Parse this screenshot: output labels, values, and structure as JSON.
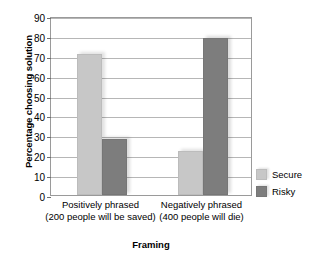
{
  "chart_data": {
    "type": "bar",
    "title": "",
    "xlabel": "Framing",
    "ylabel": "Percentage choosing solution",
    "ylim": [
      0,
      90
    ],
    "ytick_step": 10,
    "yticks": [
      90,
      80,
      70,
      60,
      50,
      40,
      30,
      20,
      10,
      0
    ],
    "grid": true,
    "legend_position": "right",
    "categories": [
      {
        "line1": "Positively phrased",
        "line2": "(200 people will be saved)"
      },
      {
        "line1": "Negatively phrased",
        "line2": "(400 people will die)"
      }
    ],
    "series": [
      {
        "name": "Secure",
        "color": "#c7c7c7",
        "values": [
          71,
          22
        ]
      },
      {
        "name": "Risky",
        "color": "#7d7d7d",
        "values": [
          28,
          79
        ]
      }
    ]
  }
}
